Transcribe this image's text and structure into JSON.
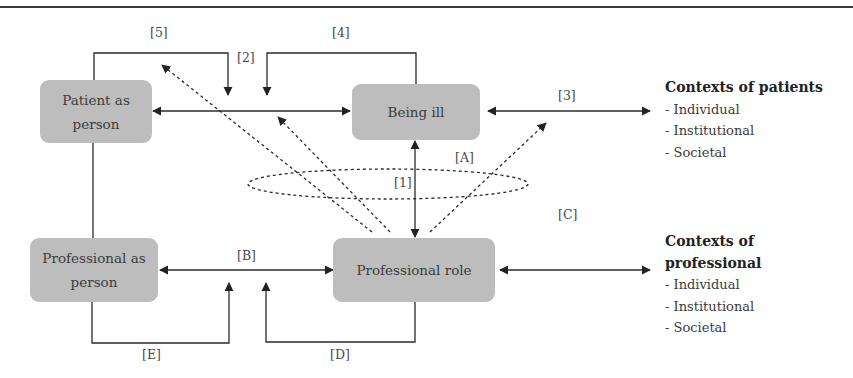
{
  "diagram": {
    "nodes": {
      "patient_as_person": "Patient as person",
      "being_ill": "Being ill",
      "professional_as_person": "Professional as person",
      "professional_role": "Professional role"
    },
    "labels": {
      "l1": "[1]",
      "l2": "[2]",
      "l3": "[3]",
      "l4": "[4]",
      "l5": "[5]",
      "lA": "[A]",
      "lB": "[B]",
      "lC": "[C]",
      "lD": "[D]",
      "lE": "[E]"
    },
    "contexts_patients": {
      "title": "Contexts of patients",
      "items": [
        "- Individual",
        "- Institutional",
        "- Societal"
      ]
    },
    "contexts_professional": {
      "title_line1": "Contexts of",
      "title_line2": "professional",
      "items": [
        "- Individual",
        "- Institutional",
        "- Societal"
      ]
    },
    "colors": {
      "node_fill": "#bdbdbd",
      "line": "#2a2a2a",
      "text": "#3a3a3a"
    }
  }
}
